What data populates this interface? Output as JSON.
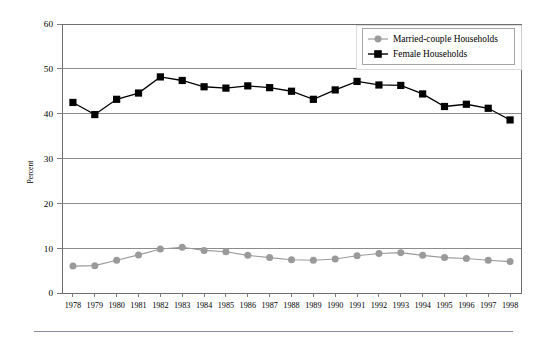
{
  "chart_data": {
    "type": "line",
    "title": "",
    "subtitle": "",
    "xlabel": "",
    "ylabel": "Percent",
    "ylim": [
      0,
      60
    ],
    "yticks": [
      0,
      10,
      20,
      30,
      40,
      50,
      60
    ],
    "ytick_labels": [
      "0",
      "10",
      "20",
      "30",
      "40",
      "50",
      "60"
    ],
    "grid": "horizontal",
    "legend_position": "top-right",
    "categories": [
      "1978",
      "1979",
      "1980",
      "1981",
      "1982",
      "1983",
      "1984",
      "1985",
      "1986",
      "1987",
      "1988",
      "1989",
      "1990",
      "1991",
      "1992",
      "1993",
      "1994",
      "1995",
      "1996",
      "1997",
      "1998"
    ],
    "x": [
      1978,
      1979,
      1980,
      1981,
      1982,
      1983,
      1984,
      1985,
      1986,
      1987,
      1988,
      1989,
      1990,
      1991,
      1992,
      1993,
      1994,
      1995,
      1996,
      1997,
      1998
    ],
    "series": [
      {
        "name": "Married-couple Households",
        "marker": "circle",
        "color": "#9a9a9a",
        "line_color": "#9a9a9a",
        "values": [
          6.0,
          6.1,
          7.3,
          8.5,
          9.8,
          10.2,
          9.5,
          9.2,
          8.4,
          7.9,
          7.4,
          7.3,
          7.6,
          8.3,
          8.8,
          9.0,
          8.4,
          7.9,
          7.7,
          7.3,
          7.0
        ]
      },
      {
        "name": "Female Households",
        "marker": "square",
        "color": "#000000",
        "line_color": "#000000",
        "values": [
          42.5,
          39.8,
          43.2,
          44.6,
          48.2,
          47.4,
          46.0,
          45.7,
          46.2,
          45.8,
          45.0,
          43.2,
          45.3,
          47.2,
          46.4,
          46.3,
          44.4,
          41.6,
          42.1,
          41.2,
          38.6
        ]
      }
    ]
  },
  "legend": {
    "items": [
      {
        "label": "Married-couple Households",
        "marker": "circle",
        "color": "#9a9a9a"
      },
      {
        "label": "Female Households",
        "marker": "square",
        "color": "#000000"
      }
    ]
  },
  "axes": {
    "y_title": "Percent"
  }
}
